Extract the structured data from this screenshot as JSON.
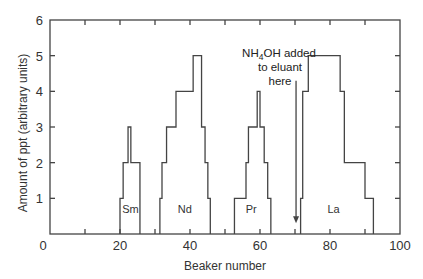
{
  "chart_data": {
    "type": "line",
    "style": "step histogram (elution profile)",
    "title": "",
    "xlabel": "Beaker number",
    "ylabel": "Amount of ppt (arbitrary units)",
    "xlim": [
      0,
      100
    ],
    "ylim": [
      0,
      6
    ],
    "x_ticks": [
      0,
      20,
      40,
      60,
      80,
      100
    ],
    "x_minor_ticks": [
      10,
      30,
      50,
      70,
      90
    ],
    "y_ticks": [
      0,
      1,
      2,
      3,
      4,
      5,
      6
    ],
    "grid": false,
    "legend": null,
    "series": [
      {
        "name": "Sm",
        "label_position": [
          23,
          0.7
        ],
        "steps": [
          [
            20,
            1
          ],
          [
            20.9,
            2
          ],
          [
            22.3,
            3
          ],
          [
            23.1,
            2
          ],
          [
            25.7,
            0
          ]
        ]
      },
      {
        "name": "Nd",
        "label_position": [
          38.5,
          0.7
        ],
        "steps": [
          [
            31.4,
            1
          ],
          [
            32,
            2
          ],
          [
            33.3,
            3
          ],
          [
            36,
            4
          ],
          [
            40.9,
            5
          ],
          [
            43.3,
            3
          ],
          [
            44.3,
            2
          ],
          [
            45.1,
            1
          ],
          [
            45.8,
            0
          ]
        ]
      },
      {
        "name": "Pr",
        "label_position": [
          57.5,
          0.7
        ],
        "steps": [
          [
            52.7,
            1
          ],
          [
            56,
            2
          ],
          [
            56.7,
            3
          ],
          [
            59.2,
            4
          ],
          [
            60,
            3
          ],
          [
            61.2,
            2
          ],
          [
            62.2,
            1
          ],
          [
            63.1,
            0
          ]
        ]
      },
      {
        "name": "La",
        "label_position": [
          81,
          0.7
        ],
        "steps": [
          [
            71.6,
            1
          ],
          [
            72.2,
            4
          ],
          [
            73.8,
            5
          ],
          [
            82.9,
            4
          ],
          [
            84.1,
            2
          ],
          [
            90,
            1
          ],
          [
            92.4,
            0
          ]
        ]
      }
    ],
    "annotations": [
      {
        "text_lines": [
          "NH4OH added",
          "to eluant",
          "here"
        ],
        "arrow_x": 70.3,
        "arrow_from_y": 4.3,
        "arrow_to_y": 0.3
      }
    ]
  },
  "axes": {
    "x_tick_labels": [
      "0",
      "20",
      "40",
      "60",
      "80",
      "100"
    ],
    "y_tick_labels": [
      "0",
      "1",
      "2",
      "3",
      "4",
      "5",
      "6"
    ],
    "xlabel": "Beaker number",
    "ylabel": "Amount of ppt  (arbitrary units)"
  },
  "annotation": {
    "line1_main": "NH",
    "line1_sub": "4",
    "line1_rest": "OH added",
    "line2": "to eluant",
    "line3": "here"
  }
}
